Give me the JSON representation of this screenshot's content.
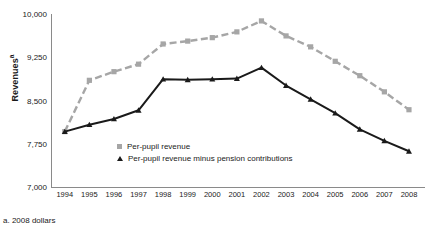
{
  "chart_data": {
    "type": "line",
    "title": "",
    "xlabel": "",
    "ylabel": "Revenues",
    "ylabel_superscript": "a",
    "ylim": [
      7000,
      10000
    ],
    "yticks": [
      7000,
      7750,
      8500,
      9250,
      10000
    ],
    "ytick_labels": [
      "7,000",
      "7,750",
      "8,500",
      "9,250",
      "10,000"
    ],
    "grid": false,
    "legend_position": "inside-bottom-left",
    "categories": [
      1994,
      1995,
      1996,
      1997,
      1998,
      1999,
      2000,
      2001,
      2002,
      2003,
      2004,
      2005,
      2006,
      2007,
      2008
    ],
    "xtick_labels": [
      "1994",
      "1995",
      "1996",
      "1997",
      "1998",
      "1999",
      "2000",
      "2001",
      "2002",
      "2003",
      "2004",
      "2005",
      "2006",
      "2007",
      "2008"
    ],
    "series": [
      {
        "name": "Per-pupil revenue",
        "color": "#a6a6a6",
        "marker": "square",
        "linestyle": "dashed",
        "values": [
          7960,
          8850,
          9000,
          9130,
          9480,
          9530,
          9590,
          9690,
          9880,
          9620,
          9430,
          9180,
          8930,
          8650,
          8340
        ]
      },
      {
        "name": "Per-pupil revenue minus pension contributions",
        "color": "#1a1a1a",
        "marker": "triangle",
        "linestyle": "solid",
        "values": [
          7960,
          8080,
          8180,
          8330,
          8870,
          8860,
          8870,
          8880,
          9070,
          8760,
          8520,
          8280,
          8000,
          7800,
          7620
        ]
      }
    ],
    "footnote": "a. 2008 dollars"
  }
}
